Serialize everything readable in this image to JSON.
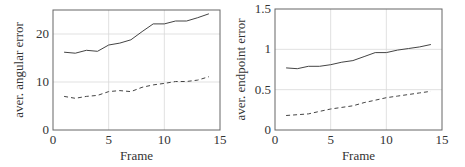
{
  "chart_data": [
    {
      "type": "line",
      "title": "",
      "xlabel": "Frame",
      "ylabel": "aver. angular error",
      "xlim": [
        0,
        15
      ],
      "ylim": [
        0,
        25
      ],
      "xticks": [
        0,
        5,
        10,
        15
      ],
      "yticks": [
        0,
        10,
        20
      ],
      "xtick_labels": [
        "0",
        "5",
        "10",
        "15"
      ],
      "ytick_labels": [
        "0",
        "10",
        "20"
      ],
      "grid": true,
      "legend": null,
      "x": [
        1,
        2,
        3,
        4,
        5,
        6,
        7,
        8,
        9,
        10,
        11,
        12,
        13,
        14
      ],
      "series": [
        {
          "name": "solid",
          "style": "solid",
          "values": [
            16.2,
            16.0,
            16.6,
            16.4,
            17.7,
            18.1,
            18.8,
            20.5,
            22.1,
            22.1,
            22.7,
            22.7,
            23.4,
            24.2
          ]
        },
        {
          "name": "dashed",
          "style": "dashed",
          "values": [
            7.0,
            6.6,
            7.0,
            7.2,
            8.0,
            8.2,
            8.0,
            8.9,
            9.4,
            9.7,
            10.1,
            10.1,
            10.4,
            11.1
          ]
        }
      ]
    },
    {
      "type": "line",
      "title": "",
      "xlabel": "Frame",
      "ylabel": "aver. endpoint error",
      "xlim": [
        0,
        15
      ],
      "ylim": [
        0,
        1.5
      ],
      "xticks": [
        0,
        5,
        10,
        15
      ],
      "yticks": [
        0,
        0.5,
        1,
        1.5
      ],
      "xtick_labels": [
        "0",
        "5",
        "10",
        "15"
      ],
      "ytick_labels": [
        "0",
        "0.5",
        "1",
        "1.5"
      ],
      "grid": true,
      "legend": null,
      "x": [
        1,
        2,
        3,
        4,
        5,
        6,
        7,
        8,
        9,
        10,
        11,
        12,
        13,
        14
      ],
      "series": [
        {
          "name": "solid",
          "style": "solid",
          "values": [
            0.77,
            0.76,
            0.79,
            0.79,
            0.81,
            0.84,
            0.86,
            0.91,
            0.96,
            0.96,
            0.99,
            1.01,
            1.03,
            1.06
          ]
        },
        {
          "name": "dashed",
          "style": "dashed",
          "values": [
            0.18,
            0.19,
            0.2,
            0.23,
            0.26,
            0.28,
            0.3,
            0.34,
            0.37,
            0.4,
            0.42,
            0.44,
            0.46,
            0.48
          ]
        }
      ]
    }
  ],
  "colors": {
    "line": "#444444",
    "axis": "#666666",
    "grid": "#d9d9d9",
    "text": "#333333"
  },
  "layout": [
    {
      "plot": {
        "x0": 53,
        "x1": 220,
        "y0": 10,
        "y1": 130
      }
    },
    {
      "plot": {
        "x0": 275,
        "x1": 442,
        "y0": 9,
        "y1": 130
      }
    }
  ]
}
